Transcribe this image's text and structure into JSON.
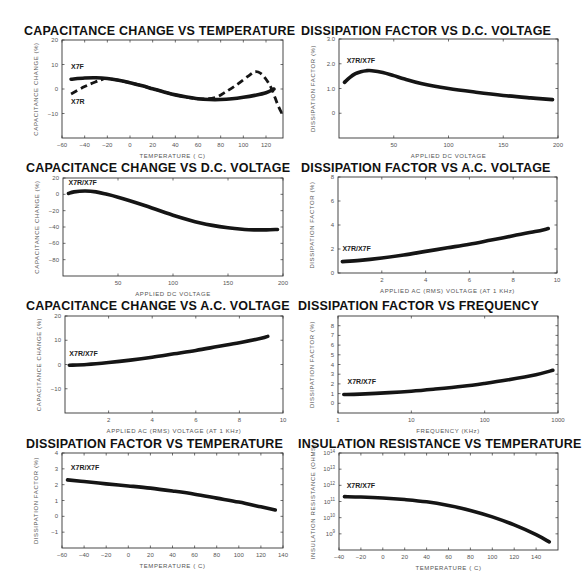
{
  "chart_data": [
    {
      "id": "cap-vs-temp",
      "type": "line",
      "title": "CAPACITANCE CHANGE VS TEMPERATURE",
      "xlabel": "TEMPERATURE ( C)",
      "ylabel": "CAPACITANCE CHANGE (%)",
      "xlim": [
        -60,
        135
      ],
      "ylim": [
        -20,
        20
      ],
      "xticks": [
        -60,
        -40,
        -20,
        0,
        20,
        40,
        60,
        80,
        100,
        120
      ],
      "yticks": [
        20,
        10,
        0,
        -10
      ],
      "grid": false,
      "series": [
        {
          "name": "X7F",
          "style": "solid",
          "x": [
            -52,
            -40,
            -30,
            -20,
            -10,
            0,
            10,
            20,
            30,
            40,
            50,
            60,
            70,
            80,
            90,
            100,
            110,
            120,
            127
          ],
          "y": [
            4,
            4.5,
            4.6,
            4.3,
            3.6,
            2.6,
            1.4,
            0.1,
            -1.2,
            -2.4,
            -3.3,
            -4,
            -4.3,
            -4.3,
            -4,
            -3.4,
            -2.6,
            -1.5,
            0
          ]
        },
        {
          "name": "X7R",
          "style": "dashed",
          "x": [
            -52,
            -40,
            -30,
            -25,
            -20,
            0,
            20,
            40,
            60,
            75,
            85,
            95,
            105,
            110,
            115,
            120,
            125,
            130,
            134
          ],
          "y": [
            -2,
            1,
            3,
            3.8,
            4.3,
            2.6,
            0.1,
            -2.4,
            -4,
            -3.5,
            -1,
            2,
            5.5,
            7,
            6.5,
            4,
            0,
            -6,
            -10
          ]
        }
      ],
      "labels": [
        {
          "text": "X7F",
          "x": -52,
          "y": 8
        },
        {
          "text": "X7R",
          "x": -52,
          "y": -6
        }
      ]
    },
    {
      "id": "df-vs-dc",
      "type": "line",
      "title": "DISSIPATION FACTOR VS D.C. VOLTAGE",
      "xlabel": "APPLIED DC VOLTAGE",
      "ylabel": "DISSIPATION FACTOR (%)",
      "xlim": [
        0,
        200
      ],
      "ylim": [
        -1,
        3
      ],
      "xticks": [
        50,
        100,
        150,
        200
      ],
      "yticks": [
        3.0,
        2.0,
        1.0,
        0
      ],
      "ytick_labels": [
        "3.0",
        "2.0",
        "1.0",
        "0"
      ],
      "grid": false,
      "series": [
        {
          "name": "X7R/X7F",
          "style": "solid",
          "x": [
            5,
            10,
            15,
            20,
            25,
            30,
            40,
            50,
            60,
            75,
            100,
            125,
            150,
            175,
            195
          ],
          "y": [
            1.25,
            1.45,
            1.6,
            1.68,
            1.72,
            1.72,
            1.65,
            1.52,
            1.38,
            1.2,
            1.0,
            0.85,
            0.72,
            0.62,
            0.55
          ]
        }
      ],
      "labels": [
        {
          "text": "X7R/X7F",
          "x": 7,
          "y": 2.05
        }
      ]
    },
    {
      "id": "cap-vs-dc",
      "type": "line",
      "title": "CAPACITANCE CHANGE VS D.C. VOLTAGE",
      "xlabel": "APPLIED DC VOLTAGE",
      "ylabel": "CAPACITANCE CHANGE (%)",
      "xlim": [
        0,
        200
      ],
      "ylim": [
        -100,
        20
      ],
      "xticks": [
        50,
        100,
        150,
        200
      ],
      "yticks": [
        20,
        0,
        -20,
        -40,
        -60,
        -80
      ],
      "grid": false,
      "series": [
        {
          "name": "X7R/X7F",
          "style": "solid",
          "x": [
            5,
            10,
            20,
            30,
            40,
            50,
            60,
            75,
            100,
            125,
            150,
            165,
            175,
            185,
            195
          ],
          "y": [
            1,
            3,
            4,
            3,
            0,
            -3.5,
            -7.5,
            -14,
            -25.5,
            -35,
            -41,
            -43,
            -43.5,
            -43.5,
            -43
          ]
        }
      ],
      "labels": [
        {
          "text": "X7R/X7F",
          "x": 5,
          "y": 12
        }
      ]
    },
    {
      "id": "df-vs-ac",
      "type": "line",
      "title": "DISSIPATION FACTOR VS A.C. VOLTAGE",
      "xlabel": "APPLIED AC (RMS) VOLTAGE (AT 1 KHz)",
      "ylabel": "DISSIPATION FACTOR (%)",
      "xlim": [
        0,
        10
      ],
      "ylim": [
        0,
        8
      ],
      "xticks": [
        2,
        4,
        6,
        8,
        10
      ],
      "yticks": [
        8,
        6,
        4,
        2,
        0
      ],
      "grid": false,
      "series": [
        {
          "name": "X7R/X7F",
          "style": "solid",
          "x": [
            0.2,
            1,
            2,
            3,
            4,
            5,
            6,
            7,
            8,
            9,
            9.6
          ],
          "y": [
            0.95,
            1.05,
            1.25,
            1.5,
            1.8,
            2.1,
            2.4,
            2.75,
            3.1,
            3.45,
            3.7
          ]
        }
      ],
      "labels": [
        {
          "text": "X7R/X7F",
          "x": 0.2,
          "y": 1.8
        }
      ]
    },
    {
      "id": "cap-vs-ac",
      "type": "line",
      "title": "CAPACITANCE CHANGE VS A.C. VOLTAGE",
      "xlabel": "APPLIED AC (RMS) VOLTAGE (AT 1 KHz)",
      "ylabel": "CAPACITANCE CHANGE (%)",
      "xlim": [
        0,
        10
      ],
      "ylim": [
        -20,
        20
      ],
      "xticks": [
        2,
        4,
        6,
        8,
        10
      ],
      "yticks": [
        20,
        10,
        0,
        -10
      ],
      "grid": false,
      "series": [
        {
          "name": "X7R/X7F",
          "style": "solid",
          "x": [
            0.2,
            1,
            2,
            3,
            4,
            5,
            6,
            7,
            8,
            9,
            9.3
          ],
          "y": [
            -0.3,
            0,
            0.8,
            1.8,
            3,
            4.4,
            5.8,
            7.4,
            9.0,
            10.8,
            11.6
          ]
        }
      ],
      "labels": [
        {
          "text": "X7R/X7F",
          "x": 0.2,
          "y": 3.5
        }
      ]
    },
    {
      "id": "df-vs-freq",
      "type": "line",
      "title": "DISSIPATION FACTOR VS FREQUENCY",
      "xlabel": "FREQUENCY (KHz)",
      "ylabel": "DISSIPATION FACTOR (%)",
      "xscale": "log",
      "xlim": [
        1,
        1000
      ],
      "ylim": [
        -1,
        9
      ],
      "xticks": [
        1,
        10,
        100,
        1000
      ],
      "yticks": [
        8,
        7,
        6,
        5,
        4,
        3,
        2,
        1,
        0
      ],
      "grid": false,
      "series": [
        {
          "name": "X7R/X7F",
          "style": "solid",
          "x": [
            1.2,
            2,
            5,
            10,
            20,
            50,
            100,
            200,
            500,
            850
          ],
          "y": [
            0.9,
            0.95,
            1.1,
            1.25,
            1.45,
            1.75,
            2.05,
            2.4,
            2.95,
            3.4
          ]
        }
      ],
      "labels": [
        {
          "text": "X7R/X7F",
          "x": 1.35,
          "y": 2.0
        }
      ]
    },
    {
      "id": "df-vs-temp",
      "type": "line",
      "title": "DISSIPATION FACTOR VS TEMPERATURE",
      "xlabel": "TEMPERATURE ( C)",
      "ylabel": "DISSIPATION FACTOR (%)",
      "xlim": [
        -60,
        140
      ],
      "ylim": [
        -2,
        4
      ],
      "xticks": [
        -60,
        -40,
        -20,
        0,
        20,
        40,
        60,
        80,
        100,
        120,
        140
      ],
      "yticks": [
        4,
        3,
        2,
        1,
        0,
        -1
      ],
      "grid": false,
      "series": [
        {
          "name": "X7R/X7F",
          "style": "solid",
          "x": [
            -55,
            -40,
            -20,
            0,
            20,
            40,
            60,
            80,
            100,
            120,
            133
          ],
          "y": [
            2.3,
            2.2,
            2.05,
            1.92,
            1.78,
            1.6,
            1.4,
            1.15,
            0.9,
            0.6,
            0.4
          ]
        }
      ],
      "labels": [
        {
          "text": "X7R/X7F",
          "x": -52,
          "y": 2.9
        }
      ]
    },
    {
      "id": "ir-vs-temp",
      "type": "line",
      "title": "INSULATION RESISTANCE VS TEMPERATURE",
      "xlabel": "TEMPERATURE ( C)",
      "ylabel": "INSULATION RESISTANCE (OHMS)",
      "xlim": [
        -40,
        160
      ],
      "ylim": [
        8,
        14
      ],
      "xticks": [
        -40,
        -20,
        0,
        20,
        40,
        60,
        80,
        100,
        120,
        140
      ],
      "yticks": [
        14,
        13,
        12,
        11,
        10,
        9
      ],
      "ytick_labels": [
        "10^14",
        "10^13",
        "10^12",
        "10^11",
        "10^10",
        "10^9"
      ],
      "grid": false,
      "series": [
        {
          "name": "X7R/X7F",
          "style": "solid",
          "x": [
            -35,
            -20,
            0,
            20,
            40,
            60,
            80,
            100,
            120,
            140,
            152
          ],
          "y": [
            11.3,
            11.28,
            11.22,
            11.12,
            10.98,
            10.75,
            10.45,
            10.05,
            9.55,
            8.95,
            8.5
          ]
        }
      ],
      "labels": [
        {
          "text": "X7R/X7F",
          "x": -33,
          "y": 11.85
        }
      ]
    }
  ]
}
